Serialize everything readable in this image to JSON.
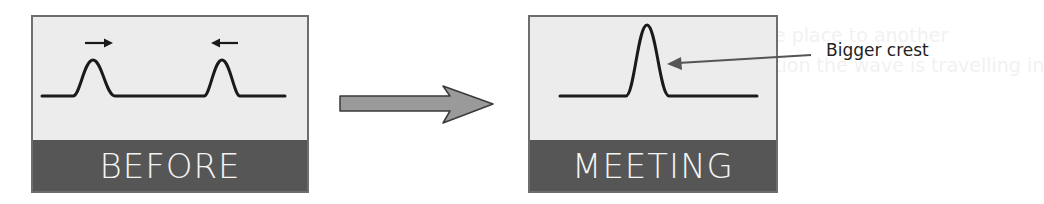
{
  "background_show_through": {
    "line_1": "from one place to another",
    "line_2": "the direction the wave is travelling in"
  },
  "panels": [
    {
      "id": "before",
      "label": "BEFORE",
      "description": "Two separate wave crests travelling toward each other",
      "direction_arrows": [
        "right-arrow",
        "left-arrow"
      ]
    },
    {
      "id": "meeting",
      "label": "MEETING",
      "description": "Crests combine into a single bigger crest",
      "callout": "Bigger crest"
    }
  ],
  "transition_arrow": "right-arrow",
  "colors": {
    "panel_fill": "#ececec",
    "panel_border": "#6e6e6e",
    "label_band": "#565656",
    "label_text": "#f4f4f4",
    "wave": "#1a1a1a",
    "big_arrow_fill": "#9a9a9a",
    "big_arrow_stroke": "#3a3a3a",
    "callout_arrow": "#555555"
  }
}
